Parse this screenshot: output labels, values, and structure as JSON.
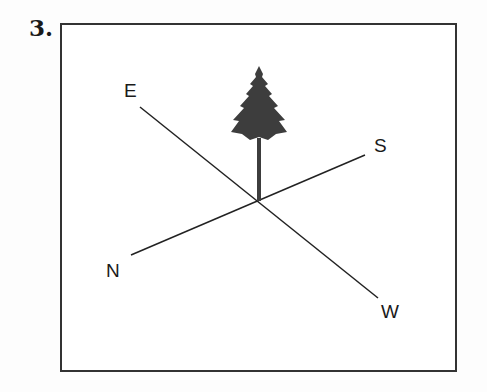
{
  "question_number": "3.",
  "diagram": {
    "tree": {
      "icon": "pine-tree-icon",
      "color": "#3d3d3d"
    },
    "directions": [
      {
        "label": "E",
        "position": "upper-left"
      },
      {
        "label": "S",
        "position": "upper-right"
      },
      {
        "label": "N",
        "position": "lower-left"
      },
      {
        "label": "W",
        "position": "lower-right"
      }
    ],
    "line_color": "#222222"
  }
}
